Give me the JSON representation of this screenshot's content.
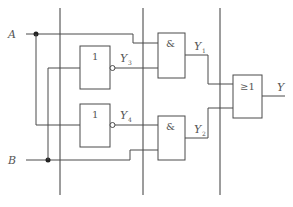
{
  "diagram": {
    "type": "logic-circuit",
    "inputs": [
      {
        "id": "A",
        "label": "A"
      },
      {
        "id": "B",
        "label": "B"
      }
    ],
    "gates": [
      {
        "id": "not_upper",
        "type": "NOT",
        "symbol": "1",
        "output_label": "Y",
        "output_sub": "3"
      },
      {
        "id": "not_lower",
        "type": "NOT",
        "symbol": "1",
        "output_label": "Y",
        "output_sub": "4"
      },
      {
        "id": "and_upper",
        "type": "AND",
        "symbol": "&",
        "output_label": "Y",
        "output_sub": "1"
      },
      {
        "id": "and_lower",
        "type": "AND",
        "symbol": "&",
        "output_label": "Y",
        "output_sub": "2"
      },
      {
        "id": "or_final",
        "type": "OR",
        "symbol": "≥1",
        "output_label": "Y"
      }
    ],
    "output": {
      "label": "Y"
    },
    "connections": [
      "A -> and_upper.in1",
      "A -> not_lower.in",
      "B -> not_upper.in",
      "B -> and_lower.in2",
      "not_upper.out (Y3) -> and_upper.in2",
      "not_lower.out (Y4) -> and_lower.in1",
      "and_upper.out (Y1) -> or_final.in1",
      "and_lower.out (Y2) -> or_final.in2",
      "or_final.out -> Y"
    ],
    "colors": {
      "line": "#4a4a4a",
      "text": "#555555",
      "background": "#ffffff"
    }
  }
}
